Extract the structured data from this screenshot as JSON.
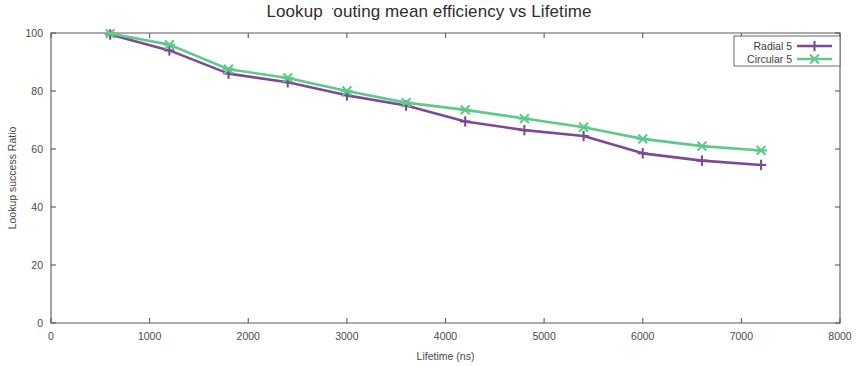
{
  "chart_data": {
    "type": "line",
    "title": "Lookup routing mean efficiency vs Lifetime",
    "xlabel": "Lifetime (ns)",
    "ylabel": "Lookup success Ratio",
    "xlim": [
      0,
      8000
    ],
    "ylim": [
      0,
      100
    ],
    "xticks": [
      0,
      1000,
      2000,
      3000,
      4000,
      5000,
      6000,
      7000,
      8000
    ],
    "yticks": [
      0,
      20,
      40,
      60,
      80,
      100
    ],
    "grid": false,
    "legend_position": "top-right",
    "x": [
      600,
      1200,
      1800,
      2400,
      3000,
      3600,
      4200,
      4800,
      5400,
      6000,
      6600,
      7200
    ],
    "series": [
      {
        "name": "Radial 5",
        "color": "#7d4a94",
        "marker": "plus",
        "values": [
          99.5,
          94.0,
          86.0,
          83.0,
          78.5,
          75.0,
          69.5,
          66.5,
          64.5,
          58.5,
          56.0,
          54.5
        ]
      },
      {
        "name": "Circular 5",
        "color": "#5fc98a",
        "marker": "cross",
        "values": [
          99.8,
          96.0,
          87.5,
          84.5,
          80.0,
          76.0,
          73.5,
          70.5,
          67.5,
          63.5,
          61.0,
          59.5
        ]
      }
    ]
  },
  "legend": {
    "entries": [
      {
        "label": "Radial 5"
      },
      {
        "label": "Circular 5"
      }
    ]
  },
  "tick_labels": {
    "x": [
      "0",
      "1000",
      "2000",
      "3000",
      "4000",
      "5000",
      "6000",
      "7000",
      "8000"
    ],
    "y": [
      "0",
      "20",
      "40",
      "60",
      "80",
      "100"
    ]
  }
}
